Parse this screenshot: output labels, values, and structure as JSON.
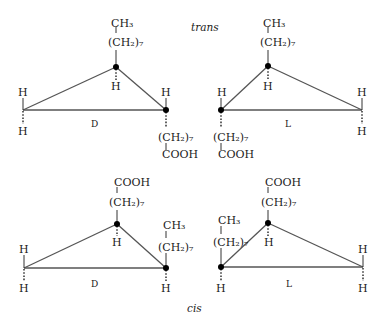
{
  "labels": {
    "trans": "trans",
    "cis": "cis"
  },
  "groups": {
    "ch3": "CH₃",
    "ch2_7": "(CH₂)₇",
    "cooh": "COOH",
    "h": "H"
  },
  "panels": [
    {
      "id": "trans-D",
      "config": "D",
      "isomer": "trans",
      "apex_up": "(CH2)7-CH3",
      "right_vertex_down": "(CH2)7-COOH"
    },
    {
      "id": "trans-L",
      "config": "L",
      "isomer": "trans",
      "apex_up": "(CH2)7-CH3",
      "left_vertex_down": "(CH2)7-COOH"
    },
    {
      "id": "cis-D",
      "config": "D",
      "isomer": "cis",
      "apex_up": "(CH2)7-COOH",
      "right_vertex_up": "(CH2)7-CH3"
    },
    {
      "id": "cis-L",
      "config": "L",
      "isomer": "cis",
      "apex_up": "(CH2)7-COOH",
      "left_vertex_up": "(CH2)7-CH3"
    }
  ],
  "config_labels": {
    "d": "D",
    "l": "L"
  }
}
